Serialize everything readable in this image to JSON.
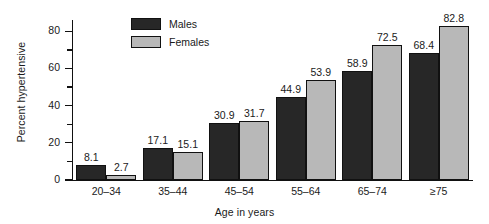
{
  "chart_data": {
    "type": "bar",
    "title": "",
    "xlabel": "Age in years",
    "ylabel": "Percent hypertensive",
    "categories": [
      "20–34",
      "35–44",
      "45–54",
      "55–64",
      "65–74",
      "≥75"
    ],
    "series": [
      {
        "name": "Males",
        "color": "#272727",
        "values": [
          8.1,
          17.1,
          30.9,
          44.9,
          58.9,
          68.4
        ]
      },
      {
        "name": "Females",
        "color": "#b8b8b8",
        "values": [
          2.7,
          15.1,
          31.7,
          53.9,
          72.5,
          82.8
        ]
      }
    ],
    "ylim": [
      0,
      85
    ],
    "y_major_ticks": [
      0,
      20,
      40,
      60,
      80
    ],
    "y_minor_ticks": [
      10,
      30,
      50,
      70
    ],
    "y_tick_labels": [
      "0",
      "20",
      "40",
      "60",
      "80"
    ],
    "grid": false,
    "legend_position": "top-center",
    "legend_entries": [
      "Males",
      "Females"
    ],
    "data_labels": [
      "8.1",
      "2.7",
      "17.1",
      "15.1",
      "30.9",
      "31.7",
      "44.9",
      "53.9",
      "58.9",
      "72.5",
      "68.4",
      "82.8"
    ]
  }
}
